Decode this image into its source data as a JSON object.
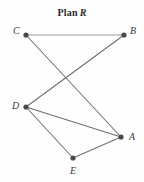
{
  "figure": {
    "title_prefix": "Plan",
    "title_letter": "R",
    "width": 144,
    "height": 182,
    "background": "#fefefe"
  },
  "colors": {
    "node_fill": "#4a4a4a",
    "edge_dark": "#6f6f6f",
    "edge_light": "#9a9a9a",
    "label_text": "#3a3a3a",
    "title_text": "#2b2b2b"
  },
  "chart_data": {
    "type": "diagram",
    "subtype": "undirected-node-link-graph",
    "nodes": [
      {
        "id": "C",
        "label": "C",
        "x": 26,
        "y": 35,
        "label_x": 13,
        "label_y": 26
      },
      {
        "id": "B",
        "label": "B",
        "x": 124,
        "y": 35,
        "label_x": 130,
        "label_y": 26
      },
      {
        "id": "D",
        "label": "D",
        "x": 26,
        "y": 107,
        "label_x": 12,
        "label_y": 101
      },
      {
        "id": "A",
        "label": "A",
        "x": 121,
        "y": 137,
        "label_x": 129,
        "label_y": 132
      },
      {
        "id": "E",
        "label": "E",
        "x": 73,
        "y": 158,
        "label_x": 70,
        "label_y": 166
      }
    ],
    "edges": [
      {
        "from": "C",
        "to": "B",
        "style": "light"
      },
      {
        "from": "C",
        "to": "A",
        "style": "dark"
      },
      {
        "from": "B",
        "to": "D",
        "style": "dark"
      },
      {
        "from": "D",
        "to": "A",
        "style": "dark"
      },
      {
        "from": "D",
        "to": "E",
        "style": "dark"
      },
      {
        "from": "E",
        "to": "A",
        "style": "dark"
      }
    ],
    "node_radius": 2.6,
    "edge_width": 1.05,
    "legend": null,
    "xlabel": "",
    "ylabel": "",
    "grid": false
  }
}
